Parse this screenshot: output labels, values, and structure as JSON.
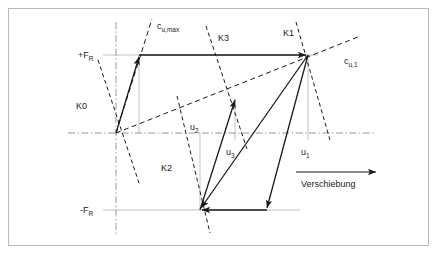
{
  "figure": {
    "type": "technical-hysteresis-diagram",
    "border_color": "#b9b9b9",
    "background": "#ffffff",
    "line_color": "#1a1a1a",
    "axis_color": "#9a9a9a",
    "guide_color": "#b0b0b0"
  },
  "axes": {
    "x_axis_label": "Verschiebung",
    "x_axis_arrow": "arrow-right",
    "origin": {
      "x": 116,
      "y": 133
    },
    "horizontal_axis": {
      "x1": 68,
      "x2": 376,
      "y": 133,
      "style": "dash-dot"
    },
    "vertical_axis": {
      "x": 116,
      "y1": 22,
      "y2": 236,
      "style": "dash-dot"
    }
  },
  "force_levels": [
    {
      "name": "positive-yield-force",
      "label": "+F",
      "sub": "R",
      "y": 55,
      "line_x1": 103,
      "line_x2": 318
    },
    {
      "name": "negative-yield-force",
      "label": "-F",
      "sub": "R",
      "y": 210,
      "line_x1": 103,
      "line_x2": 300
    }
  ],
  "stiffness_lines": [
    {
      "name": "K0",
      "label": "K0",
      "label_x": 76,
      "label_y": 106,
      "x1": 98,
      "y1": 60,
      "x2": 140,
      "y2": 186
    },
    {
      "name": "K1",
      "label": "K1",
      "label_x": 284,
      "label_y": 33,
      "x1": 296,
      "y1": 22,
      "x2": 330,
      "y2": 140
    },
    {
      "name": "K2",
      "label": "K2",
      "label_x": 160,
      "label_y": 168,
      "x1": 177,
      "y1": 96,
      "x2": 210,
      "y2": 233
    },
    {
      "name": "K3",
      "label": "K3",
      "label_x": 217,
      "label_y": 38,
      "x1": 206,
      "y1": 26,
      "x2": 247,
      "y2": 149
    }
  ],
  "envelope_lines": [
    {
      "name": "cu-max",
      "label": "c",
      "sub": "u,max",
      "label_x": 157,
      "label_y": 27,
      "x1": 116,
      "y1": 133,
      "x2": 152,
      "y2": 19
    },
    {
      "name": "cu-1",
      "label": "c",
      "sub": "u,1",
      "label_x": 342,
      "label_y": 62,
      "x1": 116,
      "y1": 133,
      "x2": 358,
      "y2": 37
    }
  ],
  "displacements": [
    {
      "name": "u1",
      "label": "u",
      "sub": "1",
      "label_x": 301,
      "label_y": 152,
      "guide_x": 308,
      "guide_y1": 55,
      "guide_y2": 140
    },
    {
      "name": "u2",
      "label": "u",
      "sub": "2",
      "label_x": 190,
      "label_y": 128,
      "guide_x": 200,
      "guide_y1": 133,
      "guide_y2": 210
    },
    {
      "name": "u3",
      "label": "u",
      "sub": "3",
      "label_x": 226,
      "label_y": 152,
      "guide_x": 235,
      "guide_y1": 98,
      "guide_y2": 140
    },
    {
      "name": "u0",
      "label": "",
      "sub": "",
      "label_x": 0,
      "label_y": 0,
      "guide_x": 139,
      "guide_y1": 55,
      "guide_y2": 133
    }
  ],
  "path_arrows": [
    {
      "name": "loading-branch-to-peak-positive",
      "x1": 116,
      "y1": 133,
      "x2": 139,
      "y2": 55
    },
    {
      "name": "plateau-positive-to-K1",
      "x1": 139,
      "y1": 55,
      "x2": 308,
      "y2": 55
    },
    {
      "name": "unloading-branch-to-negative",
      "x1": 308,
      "y1": 55,
      "x2": 200,
      "y2": 210
    },
    {
      "name": "plateau-negative-leftward",
      "x1": 267,
      "y1": 210,
      "x2": 200,
      "y2": 210
    },
    {
      "name": "reloading-branch-to-K3",
      "x1": 200,
      "y1": 210,
      "x2": 235,
      "y2": 98
    },
    {
      "name": "descending-branch-to-negative",
      "x1": 308,
      "y1": 55,
      "x2": 267,
      "y2": 210
    }
  ],
  "x_axis_arrow": {
    "x1": 296,
    "y1": 172,
    "x2": 378,
    "y2": 172,
    "label_x": 302,
    "label_y": 186
  }
}
